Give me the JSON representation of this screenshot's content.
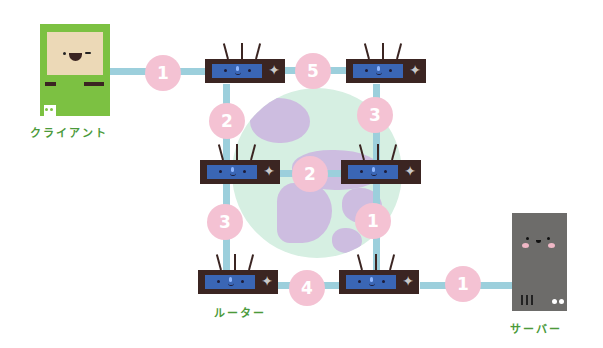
{
  "diagram": {
    "title": "",
    "nodes": {
      "client": {
        "label": "クライアント",
        "icon": "computer-icon"
      },
      "server": {
        "label": "サーバー",
        "icon": "server-icon"
      },
      "routers_label": "ルーター",
      "routers": [
        {
          "id": "r1",
          "position": "top-left"
        },
        {
          "id": "r2",
          "position": "top-right"
        },
        {
          "id": "r3",
          "position": "middle-left"
        },
        {
          "id": "r4",
          "position": "middle-right"
        },
        {
          "id": "r5",
          "position": "bottom-left"
        },
        {
          "id": "r6",
          "position": "bottom-right"
        }
      ]
    },
    "hop_costs": {
      "client_r1": "1",
      "r1_r2": "5",
      "r1_r3": "2",
      "r2_r4": "3",
      "r3_r4": "2",
      "r3_r5": "3",
      "r4_r6": "1",
      "r5_r6": "4",
      "r6_server": "1"
    },
    "colors": {
      "link": "#9ccfdc",
      "hop_badge": "#f4c2d3",
      "router_body": "#3b2522",
      "router_screen": "#3a66b5",
      "client_body": "#7cc142",
      "server_body": "#6d6c6a",
      "label_text": "#4b9a3a",
      "globe_ocean": "#d6efe2",
      "globe_land": "#cdbde0"
    }
  }
}
